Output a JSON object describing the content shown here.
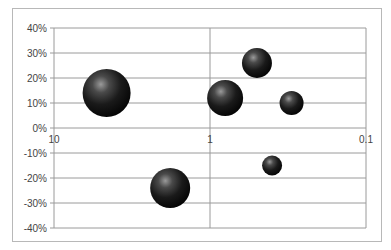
{
  "chart_data": {
    "type": "bubble",
    "title": "",
    "xlabel": "",
    "ylabel": "",
    "x_scale": "log",
    "x_reversed": true,
    "xlim": [
      10,
      0.1
    ],
    "ylim": [
      -0.4,
      0.4
    ],
    "grid": true,
    "legend": "none",
    "x_tick_labels": [
      "10",
      "1",
      "0.1"
    ],
    "y_tick_labels": [
      "40%",
      "30%",
      "20%",
      "10%",
      "0%",
      "-10%",
      "-20%",
      "-30%",
      "-40%"
    ],
    "series": [
      {
        "name": "Series 1",
        "points": [
          {
            "x": 4.6,
            "y": 0.14,
            "size": 24
          },
          {
            "x": 0.8,
            "y": 0.12,
            "size": 18
          },
          {
            "x": 0.5,
            "y": 0.26,
            "size": 15
          },
          {
            "x": 0.3,
            "y": 0.1,
            "size": 12
          },
          {
            "x": 0.4,
            "y": -0.15,
            "size": 10
          },
          {
            "x": 1.8,
            "y": -0.24,
            "size": 20
          }
        ]
      }
    ]
  },
  "colors": {
    "bubble_dark": "#111111",
    "bubble_highlight": "#8a8a8a",
    "gridline": "#9a9a9a",
    "frame": "#b8b8b8"
  }
}
